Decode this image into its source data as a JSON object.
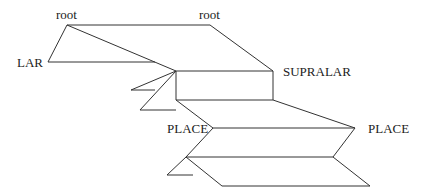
{
  "diagram": {
    "type": "feature-geometry-tree",
    "labels": {
      "root_left": "root",
      "root_right": "root",
      "lar": "LAR",
      "supralar": "SUPRALAR",
      "place_left": "PLACE",
      "place_right": "PLACE"
    },
    "line_color": "#333333",
    "background": "#ffffff"
  }
}
